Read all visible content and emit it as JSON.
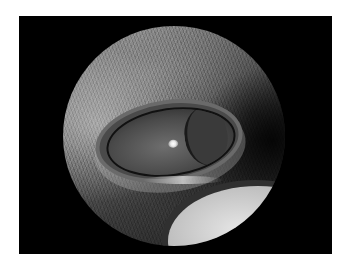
{
  "image": {
    "subject": "close-up photograph of an animal eye viewed through a circular endoscope/ophthalmoscope field",
    "colors": {
      "background": "#ffffff",
      "frame": "#000000"
    }
  }
}
